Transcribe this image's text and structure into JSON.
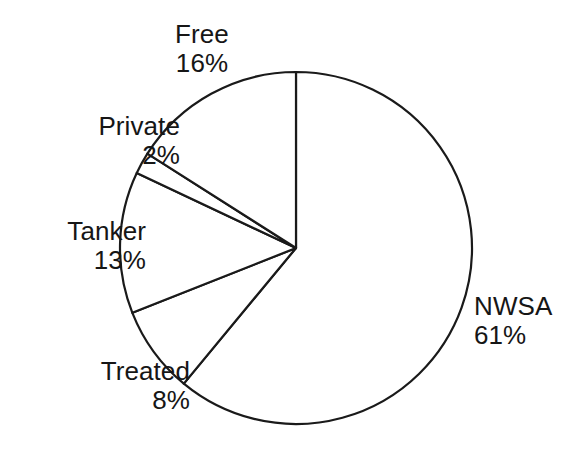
{
  "chart_data": {
    "type": "pie",
    "title": "",
    "subtitle": "",
    "xlabel": "",
    "ylabel": "",
    "legend_position": "none",
    "grid": false,
    "label_format": "name + percentage",
    "start_angle_deg": 0,
    "direction": "clockwise",
    "units": "percent",
    "total": 100,
    "categories": [
      "NWSA",
      "Treated",
      "Tanker",
      "Private",
      "Free"
    ],
    "values": [
      61,
      8,
      13,
      2,
      16
    ],
    "slices": [
      {
        "name": "NWSA",
        "value": 61,
        "percent_text": "61%",
        "start_deg": 0,
        "end_deg": 219.6,
        "fill": "#ffffff",
        "stroke": "#1a1a1a",
        "label_align": "left"
      },
      {
        "name": "Treated",
        "value": 8,
        "percent_text": "8%",
        "start_deg": 219.6,
        "end_deg": 248.4,
        "fill": "#ffffff",
        "stroke": "#1a1a1a",
        "label_align": "center"
      },
      {
        "name": "Tanker",
        "value": 13,
        "percent_text": "13%",
        "start_deg": 248.4,
        "end_deg": 295.2,
        "fill": "#ffffff",
        "stroke": "#1a1a1a",
        "label_align": "right"
      },
      {
        "name": "Private",
        "value": 2,
        "percent_text": "2%",
        "start_deg": 295.2,
        "end_deg": 302.4,
        "fill": "#ffffff",
        "stroke": "#1a1a1a",
        "label_align": "right"
      },
      {
        "name": "Free",
        "value": 16,
        "percent_text": "16%",
        "start_deg": 302.4,
        "end_deg": 360,
        "fill": "#ffffff",
        "stroke": "#1a1a1a",
        "label_align": "center"
      }
    ]
  },
  "labels": {
    "free": {
      "name": "Free",
      "percent": "16%"
    },
    "private": {
      "name": "Private",
      "percent": "2%"
    },
    "tanker": {
      "name": "Tanker",
      "percent": "13%"
    },
    "treated": {
      "name": "Treated",
      "percent": "8%"
    },
    "nwsa": {
      "name": "NWSA",
      "percent": "61%"
    }
  },
  "colors": {
    "background": "#ffffff",
    "outline": "#1a1a1a",
    "slice_fill": "#ffffff",
    "text": "#161616"
  },
  "geometry": {
    "center_x": 296,
    "center_y": 248,
    "radius": 176
  }
}
